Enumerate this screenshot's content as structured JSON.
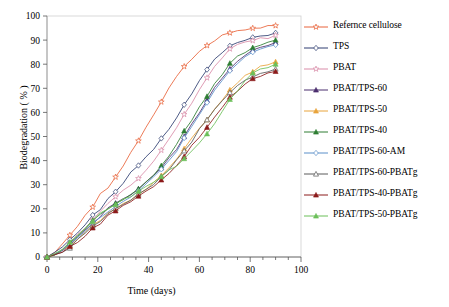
{
  "chart_data": {
    "type": "line",
    "title": "",
    "xlabel": "Time (days)",
    "ylabel": "Biodegradation ( % )",
    "xlim": [
      0,
      100
    ],
    "ylim": [
      0,
      100
    ],
    "xticks": [
      0,
      20,
      40,
      60,
      80,
      100
    ],
    "yticks": [
      0,
      10,
      20,
      30,
      40,
      50,
      60,
      70,
      80,
      90,
      100
    ],
    "xminor_step": 5,
    "grid": false,
    "legend_position": "right-outside",
    "x": [
      0,
      3,
      6,
      9,
      12,
      15,
      18,
      21,
      24,
      27,
      30,
      33,
      36,
      39,
      42,
      45,
      48,
      51,
      54,
      57,
      60,
      63,
      66,
      69,
      72,
      75,
      78,
      81,
      84,
      87,
      90
    ],
    "series": [
      {
        "name": "Refernce cellulose",
        "color": "#E8633A",
        "marker": "open-star",
        "values": [
          0,
          2,
          5,
          9,
          13,
          17,
          21,
          26,
          29,
          33,
          38,
          43,
          48,
          54,
          59,
          64,
          70,
          75,
          79,
          82,
          85,
          88,
          90,
          92,
          93,
          94,
          94,
          95,
          95,
          96,
          96
        ]
      },
      {
        "name": "TPS",
        "color": "#2E3D70",
        "marker": "open-diamond",
        "values": [
          0,
          2,
          4,
          7,
          10,
          13,
          17,
          20,
          24,
          27,
          31,
          35,
          38,
          42,
          45,
          49,
          53,
          58,
          63,
          68,
          73,
          78,
          82,
          85,
          88,
          89,
          90,
          91,
          92,
          92,
          93
        ]
      },
      {
        "name": "PBAT",
        "color": "#D98BA8",
        "marker": "open-star",
        "values": [
          0,
          1,
          3,
          6,
          9,
          12,
          15,
          19,
          22,
          25,
          28,
          30,
          33,
          36,
          40,
          44,
          49,
          54,
          59,
          64,
          69,
          74,
          79,
          83,
          86,
          88,
          89,
          90,
          91,
          91,
          92
        ]
      },
      {
        "name": "PBAT/TPS-60",
        "color": "#4B2E6E",
        "marker": "filled-triangle",
        "values": [
          0,
          1,
          3,
          5,
          8,
          11,
          14,
          17,
          20,
          22,
          24,
          26,
          28,
          31,
          34,
          37,
          41,
          45,
          50,
          55,
          60,
          65,
          70,
          74,
          78,
          81,
          84,
          86,
          87,
          88,
          89
        ]
      },
      {
        "name": "PBAT/TPS-50",
        "color": "#E8A33A",
        "marker": "filled-triangle",
        "values": [
          0,
          1,
          3,
          5,
          7,
          10,
          13,
          15,
          18,
          20,
          22,
          24,
          26,
          28,
          31,
          34,
          37,
          41,
          45,
          49,
          53,
          57,
          61,
          65,
          69,
          72,
          75,
          77,
          79,
          80,
          81
        ]
      },
      {
        "name": "PBAT/TPS-40",
        "color": "#2E7D32",
        "marker": "filled-triangle",
        "values": [
          0,
          1,
          3,
          6,
          9,
          12,
          15,
          18,
          20,
          22,
          24,
          26,
          28,
          31,
          34,
          38,
          42,
          47,
          52,
          57,
          62,
          67,
          72,
          76,
          80,
          83,
          85,
          87,
          88,
          89,
          90
        ]
      },
      {
        "name": "PBAT/TPS-60-AM",
        "color": "#5B8FC9",
        "marker": "open-diamond",
        "values": [
          0,
          1,
          3,
          5,
          8,
          11,
          14,
          16,
          19,
          21,
          23,
          25,
          27,
          30,
          33,
          36,
          40,
          44,
          49,
          54,
          59,
          64,
          69,
          73,
          77,
          80,
          83,
          85,
          86,
          87,
          88
        ]
      },
      {
        "name": "PBAT/TPS-60-PBATg",
        "color": "#5A5A5A",
        "marker": "open-triangle",
        "values": [
          0,
          1,
          2,
          4,
          7,
          10,
          13,
          15,
          18,
          20,
          22,
          24,
          26,
          28,
          30,
          33,
          36,
          40,
          44,
          48,
          53,
          57,
          61,
          65,
          68,
          71,
          73,
          75,
          76,
          77,
          78
        ]
      },
      {
        "name": "PBAT/TPS-40-PBATg",
        "color": "#8B1A1A",
        "marker": "filled-triangle",
        "values": [
          0,
          1,
          2,
          4,
          6,
          9,
          12,
          14,
          17,
          19,
          21,
          23,
          25,
          27,
          29,
          32,
          35,
          38,
          42,
          46,
          50,
          54,
          58,
          62,
          66,
          69,
          72,
          74,
          75,
          76,
          77
        ]
      },
      {
        "name": "PBAT/TPS-50-PBATg",
        "color": "#6BBF59",
        "marker": "filled-triangle",
        "values": [
          0,
          1,
          3,
          6,
          9,
          12,
          15,
          18,
          20,
          22,
          24,
          25,
          27,
          29,
          31,
          33,
          36,
          38,
          41,
          44,
          47,
          51,
          55,
          60,
          65,
          69,
          73,
          76,
          78,
          79,
          80
        ]
      }
    ]
  }
}
